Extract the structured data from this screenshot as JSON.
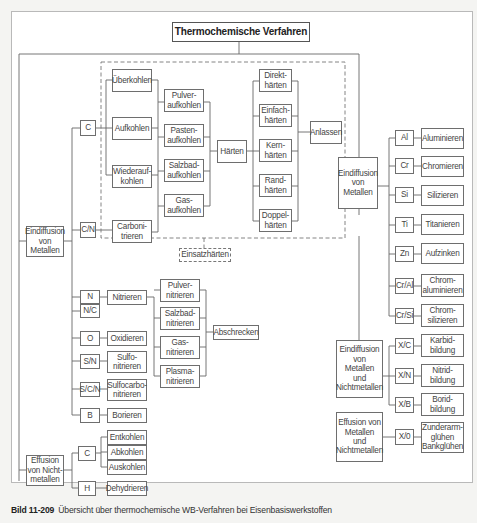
{
  "title": "Thermochemische Verfahren",
  "caption": {
    "number": "Bild 11-209",
    "text": "Übersicht über thermochemische WB-Verfahren bei Eisenbasiswerkstoffen"
  },
  "einsatzhaerten_label": "Einsatzhärten",
  "left": {
    "eindiffusion_metallen": "Eindiffusion\nvon\nMetallen",
    "effusion_nichtmetallen": "Effusion\nvon Nicht-\nmetallen",
    "elements": {
      "C": "C",
      "CN": "C/N",
      "N": "N",
      "NC": "N/C",
      "O": "O",
      "SN": "S/N",
      "SCN": "S/C/N",
      "B": "B",
      "C2": "C",
      "H": "H"
    },
    "processes": {
      "ueberkohlen": "Überkohlen",
      "aufkohlen": "Aufkohlen",
      "wiederaufkohlen": "Wiederauf-\nkohlen",
      "carbonitrieren": "Carboni-\ntrieren",
      "nitrieren": "Nitrieren",
      "oxidieren": "Oxidieren",
      "sulfonitrieren": "Sulfo-\nnitrieren",
      "sulfocarbonitrieren": "Sulfocarbo-\nnitrieren",
      "borieren": "Borieren",
      "entkohlen": "Entkohlen",
      "abkohlen": "Abkohlen",
      "auskohlen": "Auskohlen",
      "dehydrieren": "Dehydrieren"
    },
    "aufkohlen_media": {
      "pulver": "Pulver-\naufkohlen",
      "pasten": "Pasten-\naufkohlen",
      "salzbad": "Salzbad-\naufkohlen",
      "gas": "Gas-\naufkohlen"
    },
    "haerten": "Härten",
    "haerten_types": {
      "direkt": "Direkt-\nhärten",
      "einfach": "Einfach-\nhärten",
      "kern": "Kern-\nhärten",
      "rand": "Rand-\nhärten",
      "doppel": "Doppel-\nhärten"
    },
    "anlassen": "Anlassen",
    "nitrier_media": {
      "pulver": "Pulver-\nnitrieren",
      "salzbad": "Salzbad-\nnitrieren",
      "gas": "Gas-\nnitrieren",
      "plasma": "Plasma-\nnitrieren"
    },
    "abschrecken": "Abschrecken"
  },
  "right": {
    "eindiffusion_metallen": "Eindiffusion\nvon\nMetallen",
    "eindiffusion_metallen_nichtmetallen": "Eindiffusion\nvon\nMetallen\nund\nNichtmetallen",
    "effusion_metallen_nichtmetallen": "Effusion von\nMetallen\nund\nNichtmetallen",
    "metals": [
      {
        "el": "Al",
        "proc": "Aluminieren"
      },
      {
        "el": "Cr",
        "proc": "Chromieren"
      },
      {
        "el": "Si",
        "proc": "Silizieren"
      },
      {
        "el": "Ti",
        "proc": "Titanieren"
      },
      {
        "el": "Zn",
        "proc": "Aufzinken"
      },
      {
        "el": "Cr/Al",
        "proc": "Chrom-\naluminieren"
      },
      {
        "el": "Cr/Si",
        "proc": "Chrom-\nsilizieren"
      }
    ],
    "mixed": [
      {
        "el": "X/C",
        "proc": "Karbid-\nbildung"
      },
      {
        "el": "X/N",
        "proc": "Nitrid-\nbildung"
      },
      {
        "el": "X/B",
        "proc": "Borid-\nbildung"
      }
    ],
    "effusion": [
      {
        "el": "X/0",
        "proc": "Zunderarm-\nglühen\nBankglühen"
      }
    ]
  }
}
